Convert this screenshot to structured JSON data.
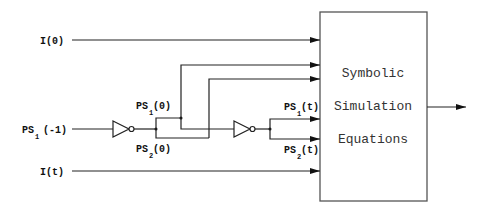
{
  "diagram": {
    "box": {
      "lines": [
        "Symbolic",
        "Simulation",
        "Equations"
      ]
    },
    "inputs": {
      "i0": {
        "main": "I(0)"
      },
      "it": {
        "main": "I(t)"
      },
      "ps1_minus1": {
        "main": "PS",
        "sub": "1",
        "suffix": "(-1)"
      },
      "ps1_0": {
        "main": "PS",
        "sub": "1",
        "suffix": "(0)"
      },
      "ps2_0": {
        "main": "PS",
        "sub": "2",
        "suffix": "(0)"
      },
      "ps1_t": {
        "main": "PS",
        "sub": "1",
        "suffix": "(t)"
      },
      "ps2_t": {
        "main": "PS",
        "sub": "2",
        "suffix": "(t)"
      }
    },
    "colors": {
      "line": "#222222",
      "box_border": "#555555",
      "text": "#111111"
    }
  }
}
